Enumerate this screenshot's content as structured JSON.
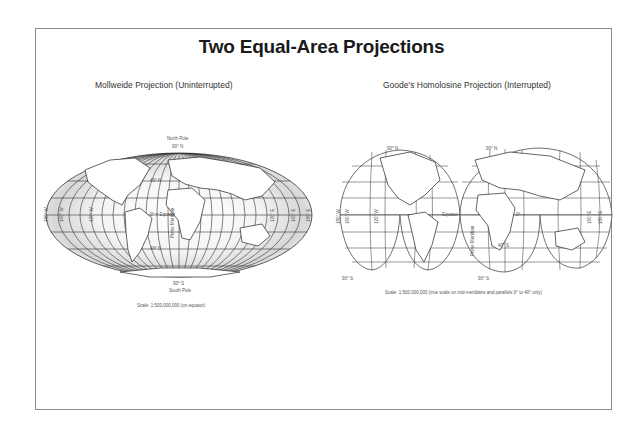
{
  "title": "Two Equal-Area Projections",
  "mollweide": {
    "heading": "Mollweide Projection (Uninterrupted)",
    "north_pole": "North Pole",
    "north_lat": "90° N",
    "lat_40n": "40° N",
    "equator": "0° = Equator",
    "lat_40s": "40° S",
    "south_lat": "90° S",
    "south_pole": "South Pole",
    "prime_meridian": "Prime Meridian",
    "lon_labels_west": [
      "180° W",
      "160° W",
      "120° W"
    ],
    "lon_labels_east": [
      "120° E",
      "160° E",
      "180° E"
    ],
    "scale": "Scale: 1:500,000,000 (on equator)"
  },
  "goode": {
    "heading": "Goode's Homolosine Projection (Interrupted)",
    "north_lat_left": "90° N",
    "north_lat_right": "90° N",
    "equator": "Equator",
    "zero": "0°",
    "lat_40s": "40° S",
    "prime_meridian": "Prime Meridian",
    "south_lat_left": "90° S",
    "south_lat_mid": "90° S",
    "lon_labels_west": [
      "180° W",
      "160° W",
      "120° W"
    ],
    "lon_labels_east": [
      "160° E",
      "180° E"
    ],
    "scale": "Scale: 1:500,000,000 (true scale on mid-meridians and parallels 0° to 40° only)"
  }
}
